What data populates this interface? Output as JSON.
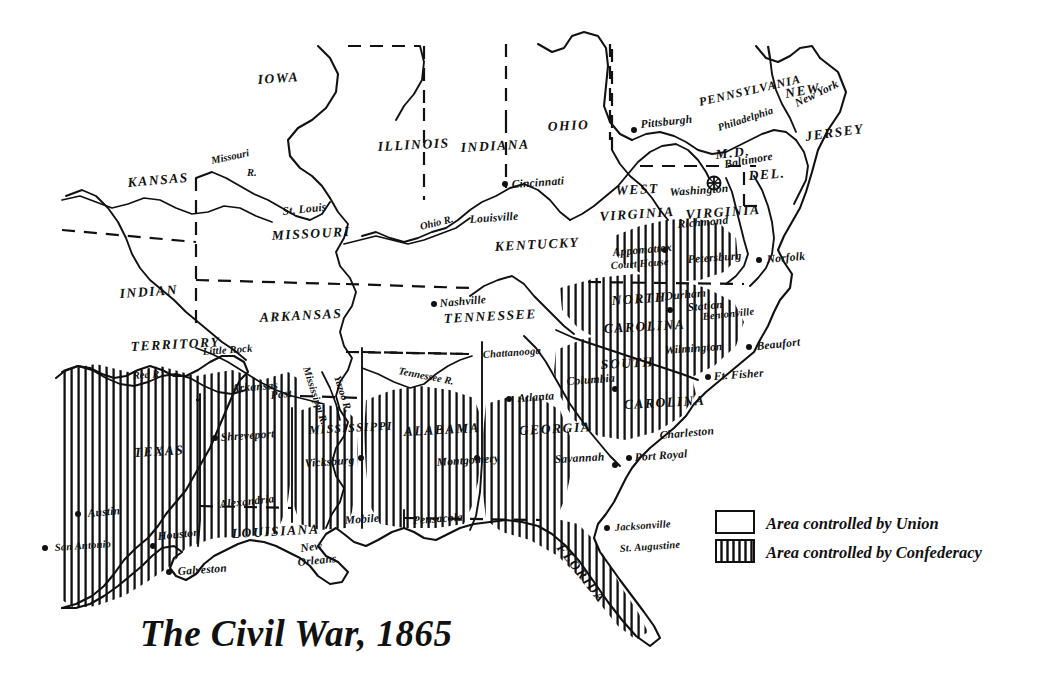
{
  "title": "The Civil War, 1865",
  "legend": {
    "items": [
      {
        "swatch": "union-swatch",
        "label": "Area controlled by Union"
      },
      {
        "swatch": "confederacy-swatch",
        "label": "Area controlled by Confederacy"
      }
    ]
  },
  "states": [
    {
      "name": "IOWA",
      "x": 258,
      "y": 84,
      "rot": -4
    },
    {
      "name": "ILLINOIS",
      "x": 378,
      "y": 151,
      "rot": -3
    },
    {
      "name": "INDIANA",
      "x": 461,
      "y": 152,
      "rot": -3
    },
    {
      "name": "OHIO",
      "x": 548,
      "y": 131,
      "rot": -3
    },
    {
      "name": "PENNSYLVANIA",
      "x": 700,
      "y": 106,
      "rot": -13
    },
    {
      "name": "NEW",
      "x": 786,
      "y": 98,
      "rot": -10
    },
    {
      "name": "JERSEY",
      "x": 806,
      "y": 141,
      "rot": -8
    },
    {
      "name": "DEL.",
      "x": 749,
      "y": 180,
      "rot": -4
    },
    {
      "name": "M.D.",
      "x": 716,
      "y": 159,
      "rot": -6
    },
    {
      "name": "KANSAS",
      "x": 128,
      "y": 187,
      "rot": -5
    },
    {
      "name": "MISSOURI",
      "x": 272,
      "y": 240,
      "rot": -3
    },
    {
      "name": "INDIAN",
      "x": 120,
      "y": 298,
      "rot": -4
    },
    {
      "name": "TERRITORY",
      "x": 131,
      "y": 351,
      "rot": -3
    },
    {
      "name": "ARKANSAS",
      "x": 260,
      "y": 322,
      "rot": -3
    },
    {
      "name": "KENTUCKY",
      "x": 495,
      "y": 251,
      "rot": -3
    },
    {
      "name": "WEST",
      "x": 616,
      "y": 195,
      "rot": -3
    },
    {
      "name": "VIRGINIA",
      "x": 600,
      "y": 221,
      "rot": -4
    },
    {
      "name": "VIRGINIA",
      "x": 686,
      "y": 219,
      "rot": -4
    },
    {
      "name": "TENNESSEE",
      "x": 444,
      "y": 323,
      "rot": -3
    },
    {
      "name": "NORTH",
      "x": 612,
      "y": 305,
      "rot": -4
    },
    {
      "name": "CAROLINA",
      "x": 604,
      "y": 333,
      "rot": -3
    },
    {
      "name": "SOUTH",
      "x": 601,
      "y": 369,
      "rot": -3
    },
    {
      "name": "CAROLINA",
      "x": 624,
      "y": 409,
      "rot": -3
    },
    {
      "name": "TEXAS",
      "x": 134,
      "y": 457,
      "rot": -3
    },
    {
      "name": "LOUISIANA",
      "x": 232,
      "y": 538,
      "rot": -3
    },
    {
      "name": "MISSISSIPPI",
      "x": 309,
      "y": 434,
      "rot": -3
    },
    {
      "name": "ALABAMA",
      "x": 404,
      "y": 436,
      "rot": -3
    },
    {
      "name": "GEORGIA",
      "x": 519,
      "y": 435,
      "rot": -3
    },
    {
      "name": "FLORIDA",
      "x": 556,
      "y": 548,
      "rot": 52
    }
  ],
  "cities": [
    {
      "name": "St. Louis",
      "x": 283,
      "y": 215,
      "dot": false,
      "rot": -6
    },
    {
      "name": "Cincinnati",
      "x": 512,
      "y": 188,
      "dot": true,
      "dx": -7,
      "dy": -4,
      "rot": -4
    },
    {
      "name": "Louisville",
      "x": 470,
      "y": 223,
      "dot": false,
      "rot": -4
    },
    {
      "name": "Pittsburgh",
      "x": 641,
      "y": 128,
      "dot": true,
      "dx": -7,
      "dy": 2,
      "rot": -6
    },
    {
      "name": "Philadelphia",
      "x": 719,
      "y": 131,
      "dot": false,
      "rot": -18
    },
    {
      "name": "New York",
      "x": 797,
      "y": 107,
      "dot": false,
      "rot": -26
    },
    {
      "name": "Baltimore",
      "x": 725,
      "y": 168,
      "dot": false,
      "rot": -10
    },
    {
      "name": "Washington",
      "x": 670,
      "y": 196,
      "dot": false,
      "rot": -4
    },
    {
      "name": "Richmond",
      "x": 678,
      "y": 228,
      "dot": false,
      "rot": -5
    },
    {
      "name": "Appomattox",
      "x": 613,
      "y": 256,
      "dot": true,
      "dx": 52,
      "dy": -6,
      "rot": -5
    },
    {
      "name": "Court House",
      "x": 611,
      "y": 269,
      "dot": false,
      "rot": -4
    },
    {
      "name": "Petersburg",
      "x": 688,
      "y": 263,
      "dot": false,
      "rot": -4
    },
    {
      "name": "Norfolk",
      "x": 767,
      "y": 263,
      "dot": true,
      "dx": -8,
      "dy": -3,
      "rot": -5
    },
    {
      "name": "Durham",
      "x": 665,
      "y": 300,
      "dot": true,
      "dx": 5,
      "dy": 10,
      "rot": -5
    },
    {
      "name": "Station",
      "x": 688,
      "y": 311,
      "dot": false,
      "rot": -5
    },
    {
      "name": "Bentonville",
      "x": 703,
      "y": 320,
      "dot": false,
      "rot": -6
    },
    {
      "name": "Wilmington",
      "x": 665,
      "y": 354,
      "dot": false,
      "rot": -4
    },
    {
      "name": "Beaufort",
      "x": 757,
      "y": 350,
      "dot": true,
      "dx": -8,
      "dy": -3,
      "rot": -6
    },
    {
      "name": "Ft. Fisher",
      "x": 714,
      "y": 380,
      "dot": true,
      "dx": -6,
      "dy": -3,
      "rot": -4
    },
    {
      "name": "Nashville",
      "x": 440,
      "y": 307,
      "dot": true,
      "dx": -6,
      "dy": -3,
      "rot": -5
    },
    {
      "name": "Chattanooga",
      "x": 483,
      "y": 358,
      "dot": false,
      "rot": -4
    },
    {
      "name": "Columbia",
      "x": 567,
      "y": 385,
      "dot": true,
      "dx": 48,
      "dy": 4,
      "rot": -4
    },
    {
      "name": "Atlanta",
      "x": 518,
      "y": 402,
      "dot": true,
      "dx": -9,
      "dy": -3,
      "rot": -4
    },
    {
      "name": "Charleston",
      "x": 660,
      "y": 439,
      "dot": false,
      "rot": -5
    },
    {
      "name": "Savannah",
      "x": 555,
      "y": 463,
      "dot": true,
      "dx": 60,
      "dy": 2,
      "rot": -3
    },
    {
      "name": "Port Royal",
      "x": 635,
      "y": 461,
      "dot": true,
      "dx": -6,
      "dy": -3,
      "rot": -4
    },
    {
      "name": "Little Rock",
      "x": 203,
      "y": 355,
      "dot": false,
      "rot": -4
    },
    {
      "name": "Arkansas",
      "x": 232,
      "y": 392,
      "dot": false,
      "rot": -4
    },
    {
      "name": "Post",
      "x": 271,
      "y": 399,
      "dot": false,
      "rot": -6
    },
    {
      "name": "Shreveport",
      "x": 221,
      "y": 441,
      "dot": true,
      "dx": -6,
      "dy": -3,
      "rot": -4
    },
    {
      "name": "Vicksburg",
      "x": 305,
      "y": 467,
      "dot": true,
      "dx": 56,
      "dy": -9,
      "rot": -4
    },
    {
      "name": "Alexandria",
      "x": 220,
      "y": 508,
      "dot": false,
      "rot": -6
    },
    {
      "name": "Mobile",
      "x": 345,
      "y": 524,
      "dot": false,
      "rot": -4
    },
    {
      "name": "Pensacola",
      "x": 413,
      "y": 524,
      "dot": false,
      "rot": -4
    },
    {
      "name": "New",
      "x": 301,
      "y": 552,
      "dot": false,
      "rot": -8
    },
    {
      "name": "Orleans",
      "x": 298,
      "y": 566,
      "dot": false,
      "rot": -6
    },
    {
      "name": "Montgomery",
      "x": 437,
      "y": 466,
      "dot": true,
      "dx": 40,
      "dy": -8,
      "rot": -4
    },
    {
      "name": "Jacksonville",
      "x": 615,
      "y": 531,
      "dot": true,
      "dx": -8,
      "dy": -3,
      "rot": -4
    },
    {
      "name": "St. Augustine",
      "x": 620,
      "y": 552,
      "dot": false,
      "rot": -4
    },
    {
      "name": "Austin",
      "x": 88,
      "y": 517,
      "dot": true,
      "dx": -10,
      "dy": -3,
      "rot": -5
    },
    {
      "name": "San Antonio",
      "x": 55,
      "y": 551,
      "dot": true,
      "dx": -10,
      "dy": -3,
      "rot": -4
    },
    {
      "name": "Houston",
      "x": 158,
      "y": 540,
      "dot": true,
      "dx": -5,
      "dy": 6,
      "rot": -6
    },
    {
      "name": "Galveston",
      "x": 178,
      "y": 575,
      "dot": true,
      "dx": -9,
      "dy": -3,
      "rot": -4
    }
  ],
  "rivers": [
    {
      "name": "Missouri",
      "x": 212,
      "y": 164,
      "rot": -12
    },
    {
      "name": "R.",
      "x": 247,
      "y": 176,
      "rot": 0
    },
    {
      "name": "Ohio R.",
      "x": 421,
      "y": 230,
      "rot": -14
    },
    {
      "name": "Mississippi R.",
      "x": 303,
      "y": 368,
      "rot": 72
    },
    {
      "name": "Yazoo R.",
      "x": 334,
      "y": 377,
      "rot": 72
    },
    {
      "name": "Red R.",
      "x": 133,
      "y": 379,
      "rot": -4
    },
    {
      "name": "Tennessee R.",
      "x": 398,
      "y": 374,
      "rot": 11
    }
  ],
  "capital_marker": {
    "name": "washington-capital-symbol",
    "x": 714,
    "y": 183
  }
}
